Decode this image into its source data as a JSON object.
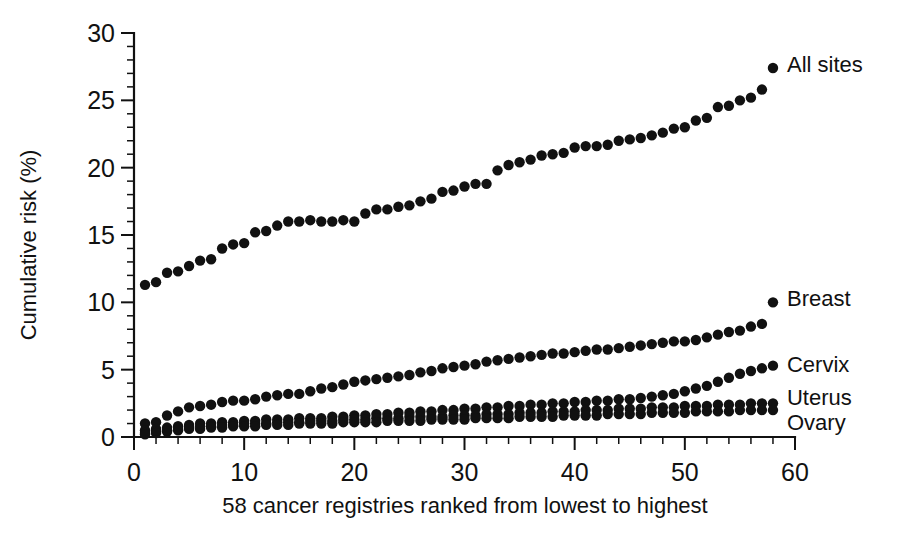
{
  "chart_data": {
    "type": "scatter",
    "title": "",
    "subtitle": "",
    "xlabel": "58 cancer registries ranked from lowest to highest",
    "ylabel": "Cumulative risk (%)",
    "xlim": [
      0,
      60
    ],
    "ylim": [
      0,
      30
    ],
    "x_major_ticks": [
      0,
      10,
      20,
      30,
      40,
      50,
      60
    ],
    "x_minor_step": 2,
    "y_major_ticks": [
      0,
      5,
      10,
      15,
      20,
      25,
      30
    ],
    "y_minor_step": 1,
    "grid": false,
    "legend_position": "right-inline",
    "marker": "filled-circle",
    "marker_color": "#111111",
    "x": [
      1,
      2,
      3,
      4,
      5,
      6,
      7,
      8,
      9,
      10,
      11,
      12,
      13,
      14,
      15,
      16,
      17,
      18,
      19,
      20,
      21,
      22,
      23,
      24,
      25,
      26,
      27,
      28,
      29,
      30,
      31,
      32,
      33,
      34,
      35,
      36,
      37,
      38,
      39,
      40,
      41,
      42,
      43,
      44,
      45,
      46,
      47,
      48,
      49,
      50,
      51,
      52,
      53,
      54,
      55,
      56,
      57,
      58
    ],
    "series": [
      {
        "name": "All sites",
        "label": "All sites",
        "values": [
          11.3,
          11.5,
          12.2,
          12.3,
          12.7,
          13.1,
          13.2,
          14.0,
          14.3,
          14.4,
          15.2,
          15.3,
          15.7,
          16.0,
          16.0,
          16.1,
          16.0,
          16.0,
          16.1,
          16.0,
          16.6,
          16.9,
          16.9,
          17.1,
          17.2,
          17.5,
          17.7,
          18.2,
          18.3,
          18.6,
          18.8,
          18.8,
          19.8,
          20.2,
          20.4,
          20.6,
          20.9,
          21.0,
          21.1,
          21.5,
          21.6,
          21.6,
          21.7,
          22.0,
          22.1,
          22.2,
          22.4,
          22.6,
          22.9,
          23.0,
          23.5,
          23.7,
          24.5,
          24.6,
          25.0,
          25.2,
          25.8,
          27.4
        ]
      },
      {
        "name": "Breast",
        "label": "Breast",
        "values": [
          1.0,
          1.1,
          1.6,
          1.9,
          2.2,
          2.3,
          2.4,
          2.6,
          2.7,
          2.7,
          2.8,
          3.0,
          3.1,
          3.2,
          3.2,
          3.4,
          3.6,
          3.7,
          3.9,
          4.1,
          4.2,
          4.3,
          4.4,
          4.5,
          4.6,
          4.8,
          4.9,
          5.1,
          5.2,
          5.3,
          5.4,
          5.6,
          5.7,
          5.8,
          5.9,
          6.0,
          6.1,
          6.2,
          6.2,
          6.3,
          6.4,
          6.5,
          6.5,
          6.6,
          6.7,
          6.8,
          6.9,
          7.0,
          7.1,
          7.1,
          7.2,
          7.4,
          7.6,
          7.8,
          7.9,
          8.2,
          8.4,
          10.0
        ]
      },
      {
        "name": "Cervix",
        "label": "Cervix",
        "values": [
          0.5,
          0.6,
          0.7,
          0.8,
          0.9,
          1.0,
          1.0,
          1.1,
          1.1,
          1.2,
          1.2,
          1.3,
          1.3,
          1.3,
          1.4,
          1.4,
          1.4,
          1.5,
          1.5,
          1.6,
          1.6,
          1.7,
          1.7,
          1.8,
          1.8,
          1.9,
          1.9,
          2.0,
          2.0,
          2.1,
          2.1,
          2.2,
          2.2,
          2.3,
          2.3,
          2.4,
          2.4,
          2.5,
          2.5,
          2.6,
          2.6,
          2.7,
          2.7,
          2.8,
          2.8,
          2.9,
          3.0,
          3.1,
          3.2,
          3.4,
          3.6,
          3.8,
          4.1,
          4.4,
          4.7,
          4.9,
          5.1,
          5.3
        ]
      },
      {
        "name": "Uterus",
        "label": "Uterus",
        "values": [
          0.3,
          0.4,
          0.5,
          0.6,
          0.7,
          0.8,
          0.8,
          0.9,
          0.9,
          1.0,
          1.0,
          1.0,
          1.1,
          1.1,
          1.1,
          1.2,
          1.2,
          1.2,
          1.3,
          1.3,
          1.3,
          1.4,
          1.4,
          1.4,
          1.5,
          1.5,
          1.5,
          1.5,
          1.6,
          1.6,
          1.6,
          1.7,
          1.7,
          1.7,
          1.8,
          1.8,
          1.8,
          1.9,
          1.9,
          1.9,
          2.0,
          2.0,
          2.0,
          2.1,
          2.1,
          2.1,
          2.2,
          2.2,
          2.2,
          2.3,
          2.3,
          2.3,
          2.4,
          2.4,
          2.4,
          2.5,
          2.5,
          2.5
        ]
      },
      {
        "name": "Ovary",
        "label": "Ovary",
        "values": [
          0.2,
          0.3,
          0.4,
          0.5,
          0.6,
          0.6,
          0.7,
          0.7,
          0.8,
          0.8,
          0.8,
          0.9,
          0.9,
          0.9,
          1.0,
          1.0,
          1.0,
          1.0,
          1.1,
          1.1,
          1.1,
          1.1,
          1.2,
          1.2,
          1.2,
          1.2,
          1.3,
          1.3,
          1.3,
          1.3,
          1.4,
          1.4,
          1.4,
          1.4,
          1.5,
          1.5,
          1.5,
          1.5,
          1.6,
          1.6,
          1.6,
          1.6,
          1.7,
          1.7,
          1.7,
          1.7,
          1.8,
          1.8,
          1.8,
          1.8,
          1.9,
          1.9,
          1.9,
          1.9,
          2.0,
          2.0,
          2.0,
          2.0
        ]
      }
    ]
  },
  "geometry": {
    "x0_px": 134,
    "x60_px": 795,
    "y0_px": 437,
    "y30_px": 33
  }
}
